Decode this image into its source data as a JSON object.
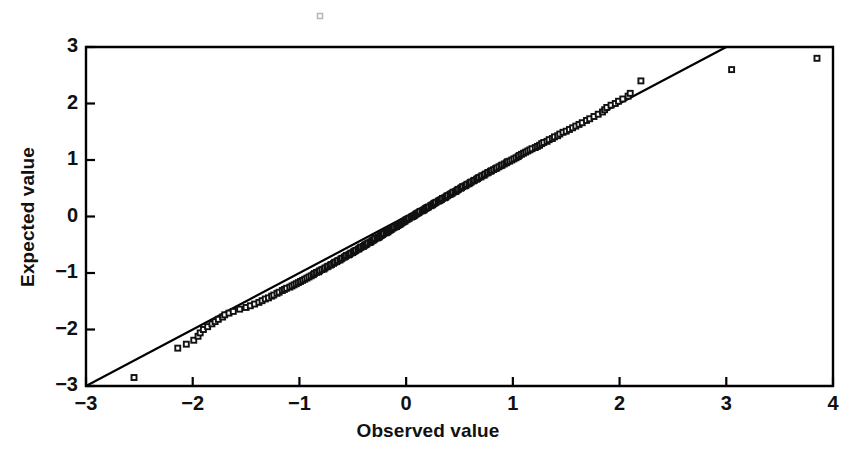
{
  "chart_data": {
    "type": "scatter",
    "title": "",
    "subtitle": "",
    "xlabel": "Observed value",
    "ylabel": "Expected value",
    "xlim": [
      -3,
      4
    ],
    "ylim": [
      -3,
      3
    ],
    "xticks": [
      -3,
      -2,
      -1,
      0,
      1,
      2,
      3,
      4
    ],
    "yticks": [
      -3,
      -2,
      -1,
      0,
      1,
      2,
      3
    ],
    "xticklabels": [
      "−3",
      "−2",
      "−1",
      "0",
      "1",
      "2",
      "3",
      "4"
    ],
    "yticklabels": [
      "−3",
      "−2",
      "−1",
      "0",
      "1",
      "2",
      "3"
    ],
    "grid": false,
    "legend": null,
    "marker": "open-square",
    "marker_size": 5,
    "series": [
      {
        "name": "Normal probability plot points",
        "type": "scatter",
        "points": [
          [
            -2.55,
            -2.85
          ],
          [
            -2.14,
            -2.33
          ],
          [
            -2.06,
            -2.26
          ],
          [
            -1.99,
            -2.19
          ],
          [
            -1.95,
            -2.12
          ],
          [
            -1.93,
            -2.06
          ],
          [
            -1.9,
            -2.0
          ],
          [
            -1.86,
            -1.95
          ],
          [
            -1.82,
            -1.9
          ],
          [
            -1.79,
            -1.86
          ],
          [
            -1.76,
            -1.82
          ],
          [
            -1.72,
            -1.78
          ],
          [
            -1.7,
            -1.74
          ],
          [
            -1.66,
            -1.71
          ],
          [
            -1.62,
            -1.68
          ],
          [
            -1.56,
            -1.64
          ],
          [
            -1.5,
            -1.61
          ],
          [
            -1.46,
            -1.58
          ],
          [
            -1.42,
            -1.55
          ],
          [
            -1.38,
            -1.52
          ],
          [
            -1.35,
            -1.49
          ],
          [
            -1.32,
            -1.46
          ],
          [
            -1.29,
            -1.44
          ],
          [
            -1.26,
            -1.41
          ],
          [
            -1.24,
            -1.39
          ],
          [
            -1.21,
            -1.36
          ],
          [
            -1.19,
            -1.34
          ],
          [
            -1.16,
            -1.31
          ],
          [
            -1.14,
            -1.29
          ],
          [
            -1.12,
            -1.27
          ],
          [
            -1.09,
            -1.25
          ],
          [
            -1.07,
            -1.23
          ],
          [
            -1.05,
            -1.21
          ],
          [
            -1.03,
            -1.19
          ],
          [
            -1.01,
            -1.17
          ],
          [
            -0.99,
            -1.15
          ],
          [
            -0.97,
            -1.13
          ],
          [
            -0.95,
            -1.11
          ],
          [
            -0.93,
            -1.09
          ],
          [
            -0.91,
            -1.07
          ],
          [
            -0.89,
            -1.05
          ],
          [
            -0.87,
            -1.03
          ],
          [
            -0.86,
            -1.01
          ],
          [
            -0.84,
            -0.99
          ],
          [
            -0.82,
            -0.98
          ],
          [
            -0.81,
            -0.96
          ],
          [
            -0.79,
            -0.94
          ],
          [
            -0.77,
            -0.93
          ],
          [
            -0.76,
            -0.91
          ],
          [
            -0.74,
            -0.89
          ],
          [
            -0.73,
            -0.88
          ],
          [
            -0.71,
            -0.86
          ],
          [
            -0.7,
            -0.85
          ],
          [
            -0.68,
            -0.83
          ],
          [
            -0.67,
            -0.81
          ],
          [
            -0.65,
            -0.8
          ],
          [
            -0.64,
            -0.78
          ],
          [
            -0.62,
            -0.77
          ],
          [
            -0.61,
            -0.75
          ],
          [
            -0.6,
            -0.74
          ],
          [
            -0.58,
            -0.72
          ],
          [
            -0.57,
            -0.71
          ],
          [
            -0.56,
            -0.69
          ],
          [
            -0.54,
            -0.68
          ],
          [
            -0.53,
            -0.67
          ],
          [
            -0.52,
            -0.65
          ],
          [
            -0.5,
            -0.64
          ],
          [
            -0.49,
            -0.62
          ],
          [
            -0.48,
            -0.61
          ],
          [
            -0.47,
            -0.6
          ],
          [
            -0.45,
            -0.58
          ],
          [
            -0.44,
            -0.57
          ],
          [
            -0.43,
            -0.55
          ],
          [
            -0.42,
            -0.54
          ],
          [
            -0.4,
            -0.53
          ],
          [
            -0.39,
            -0.51
          ],
          [
            -0.38,
            -0.5
          ],
          [
            -0.37,
            -0.49
          ],
          [
            -0.36,
            -0.47
          ],
          [
            -0.34,
            -0.46
          ],
          [
            -0.33,
            -0.45
          ],
          [
            -0.32,
            -0.43
          ],
          [
            -0.31,
            -0.42
          ],
          [
            -0.3,
            -0.41
          ],
          [
            -0.29,
            -0.39
          ],
          [
            -0.27,
            -0.38
          ],
          [
            -0.26,
            -0.37
          ],
          [
            -0.25,
            -0.36
          ],
          [
            -0.24,
            -0.34
          ],
          [
            -0.23,
            -0.33
          ],
          [
            -0.22,
            -0.32
          ],
          [
            -0.21,
            -0.3
          ],
          [
            -0.19,
            -0.29
          ],
          [
            -0.18,
            -0.28
          ],
          [
            -0.17,
            -0.27
          ],
          [
            -0.16,
            -0.25
          ],
          [
            -0.15,
            -0.24
          ],
          [
            -0.14,
            -0.23
          ],
          [
            -0.13,
            -0.21
          ],
          [
            -0.12,
            -0.2
          ],
          [
            -0.11,
            -0.19
          ],
          [
            -0.09,
            -0.18
          ],
          [
            -0.08,
            -0.16
          ],
          [
            -0.07,
            -0.15
          ],
          [
            -0.06,
            -0.14
          ],
          [
            -0.05,
            -0.13
          ],
          [
            -0.04,
            -0.11
          ],
          [
            -0.03,
            -0.1
          ],
          [
            -0.02,
            -0.09
          ],
          [
            -0.01,
            -0.08
          ],
          [
            0.0,
            -0.06
          ],
          [
            0.01,
            -0.05
          ],
          [
            0.02,
            -0.04
          ],
          [
            0.03,
            -0.03
          ],
          [
            0.05,
            -0.01
          ],
          [
            0.06,
            0.0
          ],
          [
            0.07,
            0.01
          ],
          [
            0.08,
            0.02
          ],
          [
            0.09,
            0.04
          ],
          [
            0.1,
            0.05
          ],
          [
            0.11,
            0.06
          ],
          [
            0.12,
            0.07
          ],
          [
            0.13,
            0.09
          ],
          [
            0.15,
            0.1
          ],
          [
            0.16,
            0.11
          ],
          [
            0.17,
            0.12
          ],
          [
            0.18,
            0.14
          ],
          [
            0.19,
            0.15
          ],
          [
            0.2,
            0.16
          ],
          [
            0.21,
            0.17
          ],
          [
            0.23,
            0.19
          ],
          [
            0.24,
            0.2
          ],
          [
            0.25,
            0.21
          ],
          [
            0.26,
            0.23
          ],
          [
            0.27,
            0.24
          ],
          [
            0.28,
            0.25
          ],
          [
            0.3,
            0.27
          ],
          [
            0.31,
            0.28
          ],
          [
            0.32,
            0.29
          ],
          [
            0.33,
            0.3
          ],
          [
            0.34,
            0.32
          ],
          [
            0.36,
            0.33
          ],
          [
            0.37,
            0.34
          ],
          [
            0.38,
            0.36
          ],
          [
            0.39,
            0.37
          ],
          [
            0.41,
            0.39
          ],
          [
            0.42,
            0.4
          ],
          [
            0.43,
            0.41
          ],
          [
            0.44,
            0.43
          ],
          [
            0.46,
            0.44
          ],
          [
            0.47,
            0.45
          ],
          [
            0.48,
            0.47
          ],
          [
            0.49,
            0.48
          ],
          [
            0.51,
            0.5
          ],
          [
            0.52,
            0.51
          ],
          [
            0.53,
            0.53
          ],
          [
            0.55,
            0.54
          ],
          [
            0.56,
            0.55
          ],
          [
            0.57,
            0.57
          ],
          [
            0.59,
            0.58
          ],
          [
            0.6,
            0.6
          ],
          [
            0.61,
            0.61
          ],
          [
            0.63,
            0.63
          ],
          [
            0.64,
            0.64
          ],
          [
            0.66,
            0.66
          ],
          [
            0.67,
            0.67
          ],
          [
            0.68,
            0.69
          ],
          [
            0.7,
            0.7
          ],
          [
            0.71,
            0.72
          ],
          [
            0.73,
            0.73
          ],
          [
            0.74,
            0.75
          ],
          [
            0.76,
            0.77
          ],
          [
            0.77,
            0.78
          ],
          [
            0.79,
            0.8
          ],
          [
            0.8,
            0.81
          ],
          [
            0.82,
            0.83
          ],
          [
            0.84,
            0.85
          ],
          [
            0.85,
            0.86
          ],
          [
            0.87,
            0.88
          ],
          [
            0.89,
            0.9
          ],
          [
            0.9,
            0.91
          ],
          [
            0.92,
            0.93
          ],
          [
            0.94,
            0.95
          ],
          [
            0.95,
            0.97
          ],
          [
            0.97,
            0.98
          ],
          [
            0.99,
            1.0
          ],
          [
            1.01,
            1.02
          ],
          [
            1.03,
            1.04
          ],
          [
            1.05,
            1.06
          ],
          [
            1.06,
            1.08
          ],
          [
            1.08,
            1.1
          ],
          [
            1.1,
            1.12
          ],
          [
            1.12,
            1.14
          ],
          [
            1.14,
            1.16
          ],
          [
            1.16,
            1.18
          ],
          [
            1.18,
            1.2
          ],
          [
            1.21,
            1.22
          ],
          [
            1.23,
            1.24
          ],
          [
            1.25,
            1.26
          ],
          [
            1.27,
            1.29
          ],
          [
            1.29,
            1.31
          ],
          [
            1.32,
            1.33
          ],
          [
            1.34,
            1.36
          ],
          [
            1.37,
            1.38
          ],
          [
            1.39,
            1.41
          ],
          [
            1.42,
            1.43
          ],
          [
            1.44,
            1.46
          ],
          [
            1.47,
            1.49
          ],
          [
            1.5,
            1.51
          ],
          [
            1.53,
            1.54
          ],
          [
            1.56,
            1.57
          ],
          [
            1.59,
            1.6
          ],
          [
            1.62,
            1.63
          ],
          [
            1.65,
            1.66
          ],
          [
            1.69,
            1.7
          ],
          [
            1.72,
            1.73
          ],
          [
            1.76,
            1.77
          ],
          [
            1.8,
            1.81
          ],
          [
            1.84,
            1.85
          ],
          [
            1.86,
            1.89
          ],
          [
            1.88,
            1.93
          ],
          [
            1.92,
            1.97
          ],
          [
            1.96,
            2.0
          ],
          [
            1.99,
            2.04
          ],
          [
            2.03,
            2.08
          ],
          [
            2.08,
            2.13
          ],
          [
            2.1,
            2.18
          ],
          [
            2.2,
            2.4
          ],
          [
            3.05,
            2.6
          ],
          [
            3.85,
            2.8
          ]
        ]
      }
    ],
    "reference_line": {
      "name": "identity-line",
      "type": "line",
      "equation": "y = x",
      "from": [
        -3,
        -3
      ],
      "to": [
        3,
        3
      ],
      "color": "#000000"
    },
    "artifacts": [
      {
        "name": "scan-speck",
        "x": 320,
        "y": 16
      }
    ]
  },
  "style": {
    "background": "#ffffff",
    "ink": "#111111",
    "axis_color": "#000000",
    "marker_stroke": "#111111",
    "marker_fill": "#ffffff"
  }
}
